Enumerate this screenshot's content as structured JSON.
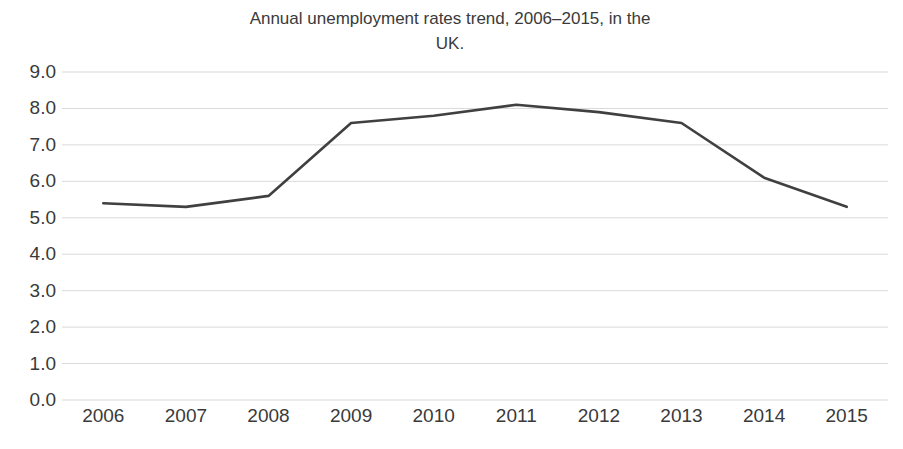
{
  "chart_data": {
    "type": "line",
    "title": "Annual unemployment rates trend, 2006–2015, in the\nUK.",
    "xlabel": "",
    "ylabel": "",
    "categories": [
      "2006",
      "2007",
      "2008",
      "2009",
      "2010",
      "2011",
      "2012",
      "2013",
      "2014",
      "2015"
    ],
    "values": [
      5.4,
      5.3,
      5.6,
      7.6,
      7.8,
      8.1,
      7.9,
      7.6,
      6.1,
      5.3
    ],
    "series": [
      {
        "name": "Unemployment rate",
        "values": [
          5.4,
          5.3,
          5.6,
          7.6,
          7.8,
          8.1,
          7.9,
          7.6,
          6.1,
          5.3
        ]
      }
    ],
    "ylim": [
      0.0,
      9.0
    ],
    "ytick_labels": [
      "9.0",
      "8.0",
      "7.0",
      "6.0",
      "5.0",
      "4.0",
      "3.0",
      "2.0",
      "1.0",
      "0.0"
    ],
    "ytick_values": [
      9.0,
      8.0,
      7.0,
      6.0,
      5.0,
      4.0,
      3.0,
      2.0,
      1.0,
      0.0
    ],
    "xtick_labels": [
      "2006",
      "2007",
      "2008",
      "2009",
      "2010",
      "2011",
      "2012",
      "2013",
      "2014",
      "2015"
    ],
    "grid": "horizontal",
    "legend": "none",
    "markers": false,
    "line_color": "#404040",
    "grid_color": "#d9d9d9",
    "text_color": "#3a3a3a",
    "background_color": "#ffffff"
  }
}
